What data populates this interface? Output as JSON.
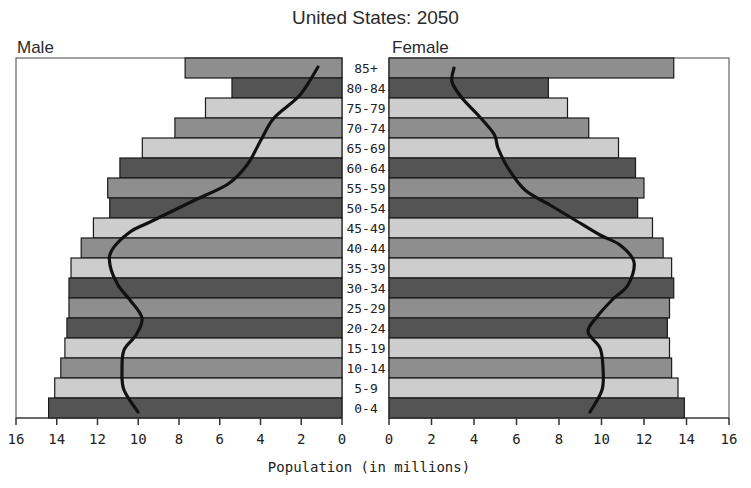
{
  "chart_data": {
    "type": "bar",
    "subtype": "population-pyramid",
    "title": "United States: 2050",
    "xlabel": "Population (in millions)",
    "ylabel": "",
    "left_label": "Male",
    "right_label": "Female",
    "xlim": [
      0,
      16
    ],
    "x_ticks": [
      16,
      14,
      12,
      10,
      8,
      6,
      4,
      2,
      0
    ],
    "x_ticks_right": [
      0,
      2,
      4,
      6,
      8,
      10,
      12,
      14,
      16
    ],
    "grid": false,
    "legend": null,
    "categories": [
      "85+",
      "80-84",
      "75-79",
      "70-74",
      "65-69",
      "60-64",
      "55-59",
      "50-54",
      "45-49",
      "40-44",
      "35-39",
      "30-34",
      "25-29",
      "20-24",
      "15-19",
      "10-14",
      "5-9",
      "0-4"
    ],
    "series": [
      {
        "name": "Male",
        "values": [
          7.7,
          5.4,
          6.7,
          8.2,
          9.8,
          10.9,
          11.5,
          11.4,
          12.2,
          12.8,
          13.3,
          13.4,
          13.4,
          13.5,
          13.6,
          13.8,
          14.1,
          14.4
        ]
      },
      {
        "name": "Female",
        "values": [
          13.4,
          7.5,
          8.4,
          9.4,
          10.8,
          11.6,
          12.0,
          11.7,
          12.4,
          12.9,
          13.3,
          13.4,
          13.2,
          13.1,
          13.2,
          13.3,
          13.6,
          13.9
        ]
      }
    ],
    "bar_shades": [
      "medium",
      "dark",
      "light",
      "medium",
      "light",
      "dark",
      "medium",
      "dark",
      "light",
      "medium",
      "light",
      "dark",
      "medium",
      "dark",
      "light",
      "medium",
      "light",
      "dark"
    ],
    "colors": {
      "light": "#cdcdcd",
      "medium": "#8e8e8e",
      "dark": "#545454",
      "outline": "#1a1a1a",
      "curve": "#111111"
    },
    "overlay_curves": {
      "description": "black outline curve overlay (comparison profile)",
      "male_points": [
        [
          318,
          67
        ],
        [
          300,
          95
        ],
        [
          274,
          118
        ],
        [
          261,
          140
        ],
        [
          247,
          165
        ],
        [
          228,
          184
        ],
        [
          195,
          200
        ],
        [
          150,
          222
        ],
        [
          130,
          232
        ],
        [
          112,
          250
        ],
        [
          110,
          265
        ],
        [
          118,
          285
        ],
        [
          130,
          300
        ],
        [
          142,
          318
        ],
        [
          136,
          335
        ],
        [
          124,
          350
        ],
        [
          122,
          370
        ],
        [
          124,
          390
        ],
        [
          138,
          412
        ]
      ],
      "female_points": [
        [
          454,
          68
        ],
        [
          452,
          82
        ],
        [
          462,
          98
        ],
        [
          478,
          115
        ],
        [
          494,
          134
        ],
        [
          498,
          148
        ],
        [
          508,
          168
        ],
        [
          525,
          190
        ],
        [
          550,
          205
        ],
        [
          575,
          220
        ],
        [
          600,
          235
        ],
        [
          620,
          245
        ],
        [
          634,
          262
        ],
        [
          628,
          285
        ],
        [
          612,
          300
        ],
        [
          596,
          318
        ],
        [
          588,
          332
        ],
        [
          600,
          348
        ],
        [
          603,
          368
        ],
        [
          602,
          390
        ],
        [
          590,
          412
        ]
      ]
    }
  }
}
